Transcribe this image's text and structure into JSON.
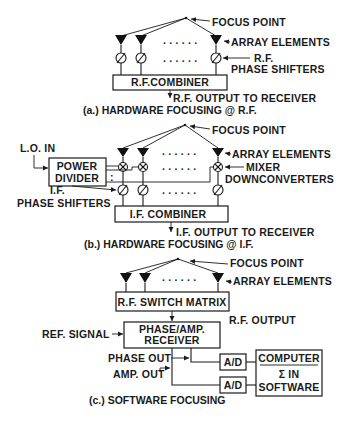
{
  "figure": {
    "panel_a": {
      "focus_point_label": "FOCUS POINT",
      "array_elements_label": "ARRAY ELEMENTS",
      "phase_shifters_label_line1": "R.F.",
      "phase_shifters_label_line2": "PHASE SHIFTERS",
      "combiner_label": "R.F.COMBINER",
      "output_label": "R.F. OUTPUT TO RECEIVER",
      "caption": "(a.) HARDWARE FOCUSING @ R.F.",
      "dots": ". . . . . ."
    },
    "panel_b": {
      "focus_point_label": "FOCUS POINT",
      "array_elements_label": "ARRAY ELEMENTS",
      "lo_in_label": "L.O. IN",
      "power_divider_line1": "POWER",
      "power_divider_line2": "DIVIDER",
      "mixer_label_line1": "MIXER",
      "mixer_label_line2": "DOWNCONVERTERS",
      "phase_shifters_label_line1": "I.F.",
      "phase_shifters_label_line2": "PHASE SHIFTERS",
      "combiner_label": "I.F. COMBINER",
      "output_label": "I.F. OUTPUT TO RECEIVER",
      "caption": "(b.) HARDWARE FOCUSING @ I.F.",
      "divider_dots": ":",
      "dots": ". . . . . ."
    },
    "panel_c": {
      "focus_point_label": "FOCUS POINT",
      "array_elements_label": "ARRAY ELEMENTS",
      "switch_matrix_label": "R.F. SWITCH MATRIX",
      "rf_output_label": "R.F. OUTPUT",
      "ref_signal_label": "REF. SIGNAL",
      "receiver_line1": "PHASE/AMP.",
      "receiver_line2": "RECEIVER",
      "phase_out_label": "PHASE OUT",
      "amp_out_label": "AMP. OUT",
      "ad_label_1": "A/D",
      "ad_label_2": "A/D",
      "computer_line1": "COMPUTER",
      "computer_line2": "Σ   IN",
      "computer_line3": "SOFTWARE",
      "caption": "(c.) SOFTWARE FOCUSING",
      "dots": ". . . . . ."
    }
  }
}
